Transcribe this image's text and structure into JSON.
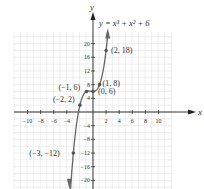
{
  "chart_data": {
    "type": "line",
    "title": "y = x³ + x² + 6",
    "xlabel": "x",
    "ylabel": "y",
    "xlim": [
      -12,
      12
    ],
    "ylim": [
      -22,
      24
    ],
    "grid": true,
    "x_ticks": [
      -10,
      -8,
      -6,
      -4,
      2,
      4,
      6,
      8,
      10
    ],
    "y_ticks": [
      20,
      16,
      12,
      8,
      4,
      -4,
      -8,
      -12,
      -16,
      -20
    ],
    "x_tick_labels": [
      "−10",
      "−8",
      "−6",
      "−4",
      "2",
      "4",
      "6",
      "8",
      "10"
    ],
    "y_tick_labels": [
      "20",
      "16",
      "12",
      "8",
      "4",
      "−4",
      "−8",
      "−12",
      "−16",
      "−20"
    ],
    "points": [
      {
        "x": -3,
        "y": -12,
        "label": "(−3, −12)"
      },
      {
        "x": -2,
        "y": 2,
        "label": "(−2, 2)"
      },
      {
        "x": -1,
        "y": 6,
        "label": "(−1, 6)"
      },
      {
        "x": 0,
        "y": 6,
        "label": "(0, 6)"
      },
      {
        "x": 1,
        "y": 8,
        "label": "(1, 8)"
      },
      {
        "x": 2,
        "y": 18,
        "label": "(2, 18)"
      }
    ],
    "function": "x^3 + x^2 + 6",
    "curve_color": "#666666"
  }
}
